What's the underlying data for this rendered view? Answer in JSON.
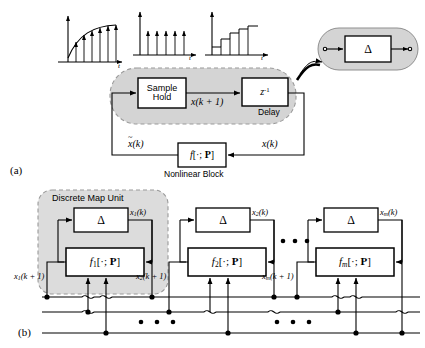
{
  "figure": {
    "panel_a_label": "(a)",
    "panel_b_label": "(b)"
  },
  "panel_a": {
    "waveforms": [
      {
        "name": "continuous-sampled-signal",
        "axis_label": "t"
      },
      {
        "name": "impulse-train",
        "axis_label": "t"
      },
      {
        "name": "staircase-hold-signal",
        "axis_label": "t"
      }
    ],
    "sample_hold_block": {
      "line1": "Sample",
      "line2": "Hold"
    },
    "delay_block": {
      "symbol": "z",
      "exponent": "-1",
      "caption": "Delay"
    },
    "signal_forward": "x(k + 1)",
    "signal_output": "x(k)",
    "signal_feedback": "x(k)",
    "nonlinear_block": {
      "label": "f[·; P]",
      "caption": "Nonlinear Block"
    },
    "inset": {
      "symbol": "Δ"
    }
  },
  "panel_b": {
    "unit_title": "Discrete Map Unit",
    "ellipsis": "•  •  •",
    "units": [
      {
        "delta": "Δ",
        "map_fn": "f",
        "map_sub": "1",
        "map_args": "[·; P]",
        "out_label": "x",
        "out_sub": "1",
        "out_suffix": "(k)",
        "in_label": "x",
        "in_sub": "1",
        "in_suffix": "(k + 1)"
      },
      {
        "delta": "Δ",
        "map_fn": "f",
        "map_sub": "2",
        "map_args": "[·; P]",
        "out_label": "x",
        "out_sub": "2",
        "out_suffix": "(k)",
        "in_label": "x",
        "in_sub": "2",
        "in_suffix": "(k + 1)"
      },
      {
        "delta": "Δ",
        "map_fn": "f",
        "map_sub": "m",
        "map_args": "[·; P]",
        "out_label": "x",
        "out_sub": "m",
        "out_suffix": "(k)",
        "in_label": "x",
        "in_sub": "m",
        "in_suffix": "(k + 1)"
      }
    ]
  },
  "colors": {
    "gray_fill": "#d4d4d4",
    "gray_fill_light": "#dcdcdc",
    "line": "#000000",
    "dashed_border": "#9a9a9a"
  }
}
